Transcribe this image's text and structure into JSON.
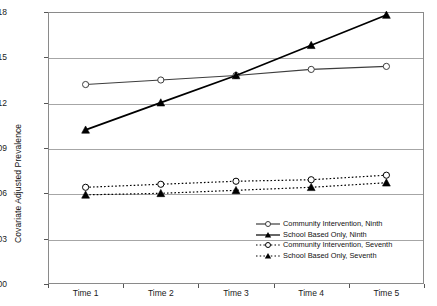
{
  "chart_data": {
    "type": "line",
    "title": "",
    "xlabel": "",
    "ylabel": "Covariate Adjusted Prevalence",
    "categories": [
      "Time 1",
      "Time 2",
      "Time 3",
      "Time 4",
      "Time 5"
    ],
    "ylim": [
      0.0,
      0.18
    ],
    "yticks": [
      "0.00",
      "0.03",
      "0.06",
      "0.09",
      "0.12",
      "0.15",
      "0.18"
    ],
    "ytick_values": [
      0.0,
      0.03,
      0.06,
      0.09,
      0.12,
      0.15,
      0.18
    ],
    "grid": "horizontal",
    "legend_position": "inside-bottom-right",
    "series": [
      {
        "name": "Community Intervention, Ninth",
        "marker": "open-circle",
        "line": "solid",
        "color": "#3d3d3d",
        "values": [
          0.132,
          0.135,
          0.138,
          0.142,
          0.144
        ]
      },
      {
        "name": "School Based Only, Ninth",
        "marker": "filled-triangle",
        "line": "solid",
        "color": "#000000",
        "values": [
          0.102,
          0.12,
          0.138,
          0.158,
          0.178
        ]
      },
      {
        "name": "Community Intervention, Seventh",
        "marker": "open-circle",
        "line": "dotted",
        "color": "#000000",
        "values": [
          0.064,
          0.066,
          0.068,
          0.069,
          0.072
        ]
      },
      {
        "name": "School Based Only, Seventh",
        "marker": "filled-triangle",
        "line": "dotted",
        "color": "#000000",
        "values": [
          0.059,
          0.06,
          0.062,
          0.064,
          0.067
        ]
      }
    ]
  },
  "legend": {
    "items": [
      {
        "label": "Community Intervention, Ninth"
      },
      {
        "label": "School Based Only, Ninth"
      },
      {
        "label": "Community Intervention, Seventh"
      },
      {
        "label": "School Based Only, Seventh"
      }
    ]
  }
}
